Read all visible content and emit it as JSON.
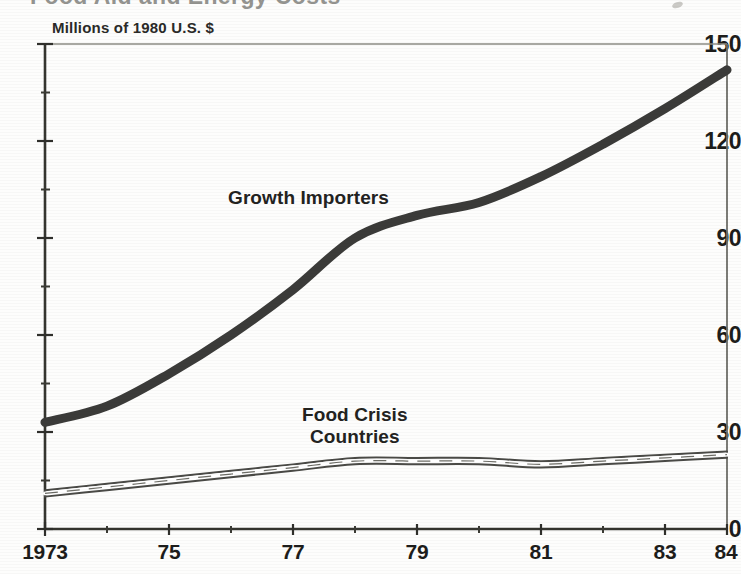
{
  "figure": {
    "title": "Food Aid and Energy Costs",
    "title_note": "top of title cropped out of frame",
    "background_color": "#fdfdfc",
    "ink_color": "#1d1d1b"
  },
  "chart_data": {
    "type": "line",
    "title": "Food Aid and Energy Costs",
    "xlabel": "",
    "ylabel": "Millions of 1980 U.S. $",
    "xlim": [
      1973,
      1984
    ],
    "ylim": [
      0,
      150
    ],
    "ytick_labels": [
      "0",
      "30",
      "60",
      "90",
      "120",
      "150"
    ],
    "ytick_values": [
      0,
      30,
      60,
      90,
      120,
      150
    ],
    "yminor_values": [
      15,
      45,
      75,
      105,
      135
    ],
    "xtick_labels": [
      "1973",
      "75",
      "77",
      "79",
      "81",
      "83",
      "84"
    ],
    "xtick_values": [
      1973,
      1975,
      1977,
      1979,
      1981,
      1983,
      1984
    ],
    "xminor_values": [
      1974,
      1976,
      1978,
      1980,
      1982
    ],
    "grid": false,
    "legend_position": "inline-annotations",
    "x": [
      1973,
      1974,
      1975,
      1976,
      1977,
      1978,
      1979,
      1980,
      1981,
      1982,
      1983,
      1984
    ],
    "series": [
      {
        "name": "Growth Importers",
        "style": "thick-solid",
        "color": "#3b3b39",
        "values": [
          33,
          38,
          48,
          60,
          74,
          90,
          97,
          101,
          109,
          119,
          130,
          142
        ]
      },
      {
        "name": "Food Crisis Countries",
        "style": "thin-outlined-ribbon",
        "color": "#4a4a46",
        "values": [
          11,
          13,
          15,
          17,
          19,
          21,
          21,
          21,
          20,
          21,
          22,
          23
        ]
      }
    ],
    "annotations": [
      {
        "text": "Growth Importers",
        "x": 1976.4,
        "y": 112
      },
      {
        "text": "Food Crisis Countries",
        "x": 1978.2,
        "y": 38
      }
    ]
  },
  "axis_labels": {
    "unit_caption": "Millions of 1980 U.S. $"
  },
  "series_labels": {
    "growth_importers": "Growth Importers",
    "food_crisis_line1": "Food Crisis",
    "food_crisis_line2": "Countries"
  }
}
